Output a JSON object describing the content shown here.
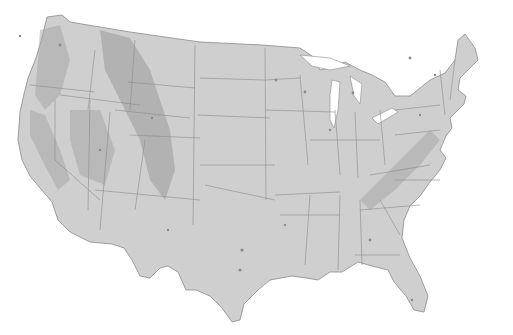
{
  "map": {
    "title": "",
    "type": "shaded-relief",
    "region": "Contiguous United States",
    "style": "grayscale",
    "features": [
      "state-boundaries",
      "terrain-relief",
      "urban-areas",
      "great-lakes"
    ],
    "colors": {
      "background": "#ffffff",
      "land": "#cfcfcf",
      "relief": "#a8a8a8",
      "border": "#8c8c8c"
    },
    "labels": []
  }
}
